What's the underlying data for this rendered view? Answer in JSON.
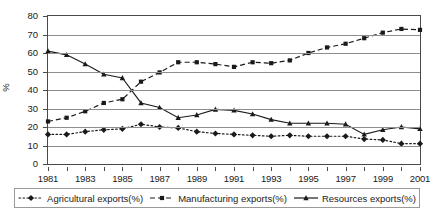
{
  "chart_data": {
    "type": "line",
    "title": "",
    "xlabel": "",
    "ylabel": "%",
    "xlim": [
      1981,
      2001
    ],
    "ylim": [
      0,
      80
    ],
    "ytick_values": [
      0,
      10,
      20,
      30,
      40,
      50,
      60,
      70,
      80
    ],
    "ytick_labels": [
      "0",
      "10",
      "20",
      "30",
      "40",
      "50",
      "60",
      "70",
      "80"
    ],
    "xtick_values": [
      1981,
      1982,
      1983,
      1984,
      1985,
      1986,
      1987,
      1988,
      1989,
      1990,
      1991,
      1992,
      1993,
      1994,
      1995,
      1996,
      1997,
      1998,
      1999,
      2000,
      2001
    ],
    "xtick_labels": [
      "1981",
      "",
      "1983",
      "",
      "1985",
      "",
      "1987",
      "",
      "1989",
      "",
      "1991",
      "",
      "1993",
      "",
      "1995",
      "",
      "1997",
      "",
      "1999",
      "",
      "2001"
    ],
    "x": [
      1981,
      1982,
      1983,
      1984,
      1985,
      1986,
      1987,
      1988,
      1989,
      1990,
      1991,
      1992,
      1993,
      1994,
      1995,
      1996,
      1997,
      1998,
      1999,
      2000,
      2001
    ],
    "grid": "horizontal",
    "legend_position": "bottom",
    "series": [
      {
        "name": "Agricultural  exports(%)",
        "marker": "diamond",
        "linestyle": "dotted",
        "color": "#1a1a1a",
        "values": [
          16,
          16,
          17.5,
          18.5,
          19,
          21.5,
          20,
          19.5,
          17.5,
          16.5,
          16,
          15.5,
          15,
          15.5,
          15,
          15,
          15,
          13.5,
          13,
          11,
          11
        ]
      },
      {
        "name": "Manufacturing  exports(%)",
        "marker": "square",
        "linestyle": "dashed",
        "color": "#1a1a1a",
        "values": [
          23,
          25,
          28.5,
          33,
          35,
          44.5,
          49.5,
          55,
          55,
          54,
          52.5,
          55,
          54.5,
          56,
          60,
          63,
          65,
          68,
          71,
          73,
          72.5
        ]
      },
      {
        "name": "Resources exports(%)",
        "marker": "triangle",
        "linestyle": "solid",
        "color": "#1a1a1a",
        "values": [
          61,
          59,
          54,
          48.5,
          46.5,
          33,
          30.5,
          25,
          26.5,
          29.5,
          29,
          27,
          24,
          22,
          22,
          22,
          21.5,
          16,
          18.5,
          20,
          19
        ]
      }
    ]
  }
}
